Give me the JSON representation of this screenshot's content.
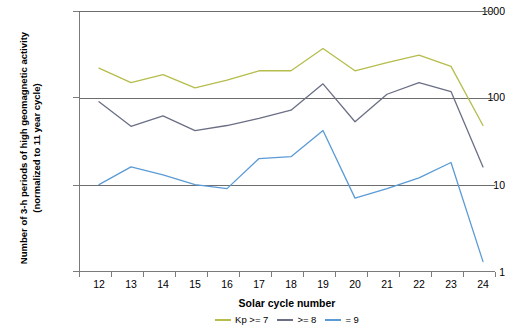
{
  "chart_data": {
    "type": "line",
    "title": "",
    "xlabel": "Solar cycle number",
    "ylabel": "Number of 3-h periods of high geomagnetic activity (normalized to 11 year cycle)",
    "ylabel_line1": "Number of 3-h periods of high geomagnetic activity",
    "ylabel_line2": "(normalized to 11 year cycle)",
    "yscale": "log",
    "ylim": [
      1,
      1000
    ],
    "ytick_labels": [
      "1000",
      "100",
      "10",
      "1"
    ],
    "ytick_values": [
      1000,
      100,
      10,
      1
    ],
    "grid": "horizontal gridlines at 1000, 100, 10",
    "legend_position": "bottom-center",
    "categories": [
      "12",
      "13",
      "14",
      "15",
      "16",
      "17",
      "18",
      "19",
      "20",
      "21",
      "22",
      "23",
      "24"
    ],
    "x": [
      12,
      13,
      14,
      15,
      16,
      17,
      18,
      19,
      20,
      21,
      22,
      23,
      24
    ],
    "series": [
      {
        "name": "Kp >= 7",
        "color": "#b6bd4c",
        "values": [
          220,
          150,
          185,
          130,
          160,
          205,
          205,
          370,
          205,
          255,
          310,
          230,
          48
        ]
      },
      {
        "name": ">= 8",
        "color": "#6b6f85",
        "values": [
          90,
          47,
          62,
          42,
          48,
          58,
          72,
          145,
          53,
          110,
          150,
          118,
          16
        ]
      },
      {
        "name": "= 9",
        "color": "#5b9bd5",
        "values": [
          10,
          16,
          13,
          10,
          9,
          20,
          21,
          42,
          7,
          9,
          12,
          18,
          1.3
        ]
      }
    ]
  },
  "legend": {
    "items": [
      {
        "label": "Kp >= 7",
        "color": "#b6bd4c"
      },
      {
        "label": ">= 8",
        "color": "#6b6f85"
      },
      {
        "label": "= 9",
        "color": "#5b9bd5"
      }
    ]
  }
}
